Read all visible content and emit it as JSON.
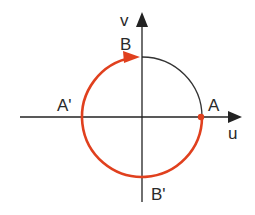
{
  "diagram": {
    "axes": {
      "x_label": "u",
      "y_label": "v"
    },
    "points": {
      "A": "A",
      "A_prime": "A'",
      "B": "B",
      "B_prime": "B'"
    },
    "colors": {
      "path": "#e0401e",
      "axis": "#222222",
      "circle": "#333333"
    },
    "path_description": "Red arc from A clockwise through B' and A' to B, with arrow at B"
  }
}
